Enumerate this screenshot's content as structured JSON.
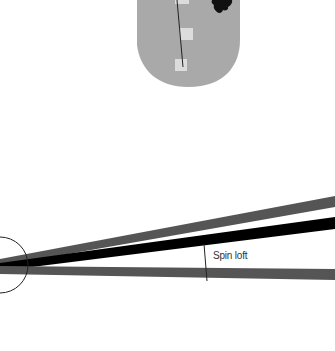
{
  "diagram": {
    "label": "Spin loft",
    "colors": {
      "fairway": "#a9a9a9",
      "marker": "#dcdcdc",
      "tree": "#111111",
      "top_line": "#555555",
      "middle_line": "#000000",
      "bottom_line": "#555555",
      "guide": "#222222"
    }
  }
}
